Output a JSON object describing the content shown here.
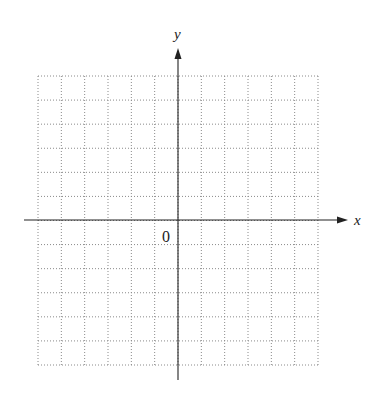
{
  "chart_data": {
    "type": "grid",
    "title": "",
    "xlabel": "x",
    "ylabel": "y",
    "origin_label": "0",
    "grid": true,
    "grid_style": "dotted",
    "grid_columns": 12,
    "grid_rows": 12,
    "x_cells_left_of_origin": 6,
    "x_cells_right_of_origin": 6,
    "y_cells_above_origin": 6,
    "y_cells_below_origin": 6,
    "xlim": [
      -6,
      6
    ],
    "ylim": [
      -6,
      6
    ],
    "series": []
  },
  "colors": {
    "axis": "#222222",
    "grid": "#8a8a8a",
    "background": "#ffffff"
  }
}
